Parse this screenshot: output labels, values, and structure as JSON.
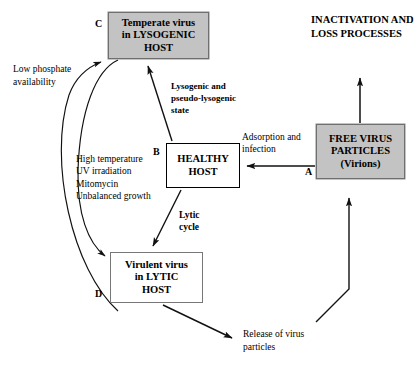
{
  "diagram": {
    "title_block": {
      "inactivation_heading": "INACTIVATION AND LOSS PROCESSES"
    },
    "nodes": {
      "a": {
        "tag": "A",
        "line1": "FREE  VIRUS",
        "line2": "PARTICLES",
        "line3": "(Virions)",
        "fill": "#c3c3c3"
      },
      "b": {
        "tag": "B",
        "line1": "HEALTHY",
        "line2": "HOST",
        "fill": "#ffffff"
      },
      "c": {
        "tag": "C",
        "line1": "Temperate virus",
        "line2": "in  LYSOGENIC",
        "line3": "HOST",
        "fill": "#c3c3c3"
      },
      "d": {
        "tag": "D",
        "line1": "Virulent virus",
        "line2": "in LYTIC",
        "line3": "HOST",
        "fill": "#ffffff"
      }
    },
    "edge_labels": {
      "low_phosphate": "Low phosphate availability",
      "triggers_line1": "High temperature",
      "triggers_line2": "UV irradiation",
      "triggers_line3": "Mitomycin",
      "triggers_line4": "Unbalanced growth",
      "lysogenic_state_line1": "Lysogenic and",
      "lysogenic_state_line2": "pseudo-lysogenic",
      "lysogenic_state_line3": "state",
      "adsorption": "Adsorption and infection",
      "lytic_cycle_line1": "Lytic",
      "lytic_cycle_line2": "cycle",
      "release": "Release of virus particles"
    },
    "colors": {
      "shaded_fill": "#c3c3c3",
      "shaded_border": "#6f6f6f",
      "plain_border_dark": "#000000",
      "plain_border_gray": "#777777",
      "line": "#111111",
      "background": "#ffffff"
    }
  }
}
